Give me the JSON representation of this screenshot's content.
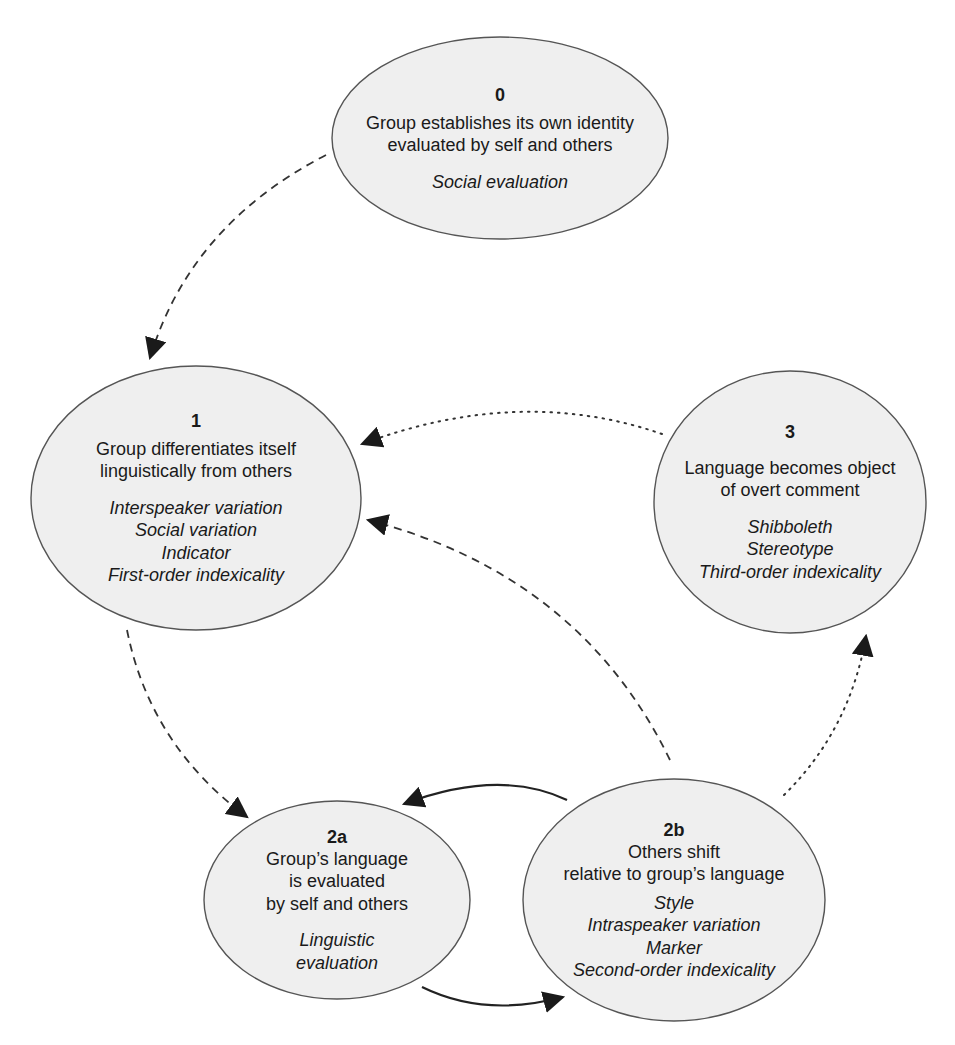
{
  "diagram": {
    "type": "cycle",
    "style": {
      "node_fill": "#efefef",
      "node_stroke": "#555555",
      "arrow_color": "#222222",
      "background": "#ffffff"
    },
    "nodes": {
      "n0": {
        "label": "0",
        "desc": [
          "Group establishes its own identity",
          "evaluated by self and others"
        ],
        "terms": [
          "Social evaluation"
        ]
      },
      "n1": {
        "label": "1",
        "desc": [
          "Group differentiates itself",
          "linguistically from others"
        ],
        "terms": [
          "Interspeaker variation",
          "Social variation",
          "Indicator",
          "First-order indexicality"
        ]
      },
      "n3": {
        "label": "3",
        "desc": [
          "Language becomes object",
          "of overt comment"
        ],
        "terms": [
          "Shibboleth",
          "Stereotype",
          "Third-order indexicality"
        ]
      },
      "n2a": {
        "label": "2a",
        "desc": [
          "Group’s language",
          "is evaluated",
          "by self and others"
        ],
        "terms": [
          "Linguistic",
          "evaluation"
        ]
      },
      "n2b": {
        "label": "2b",
        "desc": [
          "Others shift",
          "relative to group’s language"
        ],
        "terms": [
          "Style",
          "Intraspeaker variation",
          "Marker",
          "Second-order indexicality"
        ]
      }
    },
    "edges": [
      {
        "from": "0",
        "to": "1",
        "line": "dashed"
      },
      {
        "from": "1",
        "to": "2a",
        "line": "dashed"
      },
      {
        "from": "2a",
        "to": "2b",
        "line": "solid"
      },
      {
        "from": "2b",
        "to": "2a",
        "line": "solid"
      },
      {
        "from": "2b",
        "to": "1",
        "line": "dashed"
      },
      {
        "from": "2b",
        "to": "3",
        "line": "dotted"
      },
      {
        "from": "3",
        "to": "1",
        "line": "dotted"
      }
    ]
  }
}
